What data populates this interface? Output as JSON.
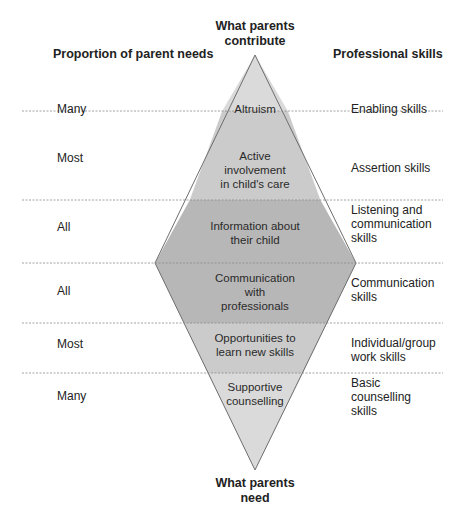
{
  "headers": {
    "top": "What parents contribute",
    "top_line1": "What parents",
    "top_line2": "contribute",
    "bottom_line1": "What parents",
    "bottom_line2": "need",
    "left": "Proportion of parent needs",
    "right": "Professional skills"
  },
  "rows": [
    {
      "proportion": "Many",
      "center": [
        "Altruism"
      ],
      "skill": [
        "Enabling skills"
      ],
      "fill": "#d9d9d9"
    },
    {
      "proportion": "Most",
      "center": [
        "Active",
        "involvement",
        "in child's care"
      ],
      "skill": [
        "Assertion skills"
      ],
      "fill": "#c9c9c9"
    },
    {
      "proportion": "All",
      "center": [
        "Information about",
        "their child"
      ],
      "skill": [
        "Listening and",
        "communication",
        "skills"
      ],
      "fill": "#b4b4b4"
    },
    {
      "proportion": "All",
      "center": [
        "Communication",
        "with",
        "professionals"
      ],
      "skill": [
        "Communication",
        "skills"
      ],
      "fill": "#b4b4b4"
    },
    {
      "proportion": "Most",
      "center": [
        "Opportunities to",
        "learn new skills"
      ],
      "skill": [
        "Individual/group",
        "work skills"
      ],
      "fill": "#c9c9c9"
    },
    {
      "proportion": "Many",
      "center": [
        "Supportive",
        "counselling"
      ],
      "skill": [
        "Basic",
        "counselling",
        "skills"
      ],
      "fill": "#d9d9d9"
    }
  ],
  "colors": {
    "line": "#777777",
    "dash": "#8a8a8a"
  }
}
